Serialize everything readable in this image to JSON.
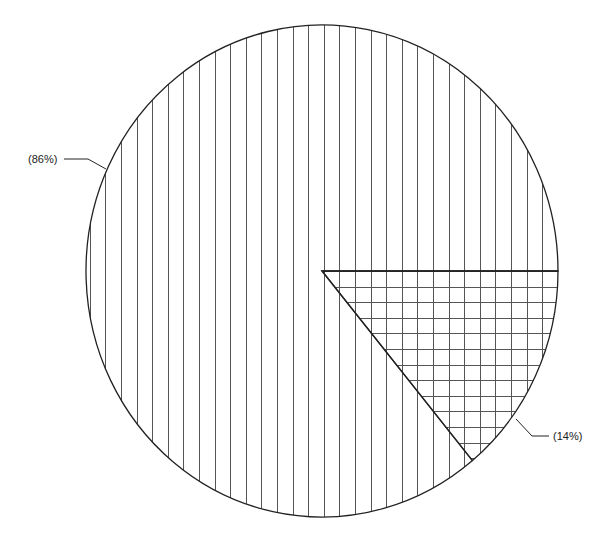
{
  "chart_data": {
    "type": "pie",
    "title": "",
    "categories": [
      "Slice A",
      "Slice B"
    ],
    "values": [
      86,
      14
    ],
    "labels": [
      "(86%)",
      "(14%)"
    ],
    "patterns": [
      "vertical-lines",
      "grid-crosshatch"
    ],
    "start_angle_deg": 0,
    "direction": "clockwise",
    "legend": "none",
    "colors": {
      "outline": "#222222",
      "hatch": "#555555",
      "background": "#ffffff"
    }
  },
  "labels": {
    "big": "(86%)",
    "small": "(14%)"
  }
}
